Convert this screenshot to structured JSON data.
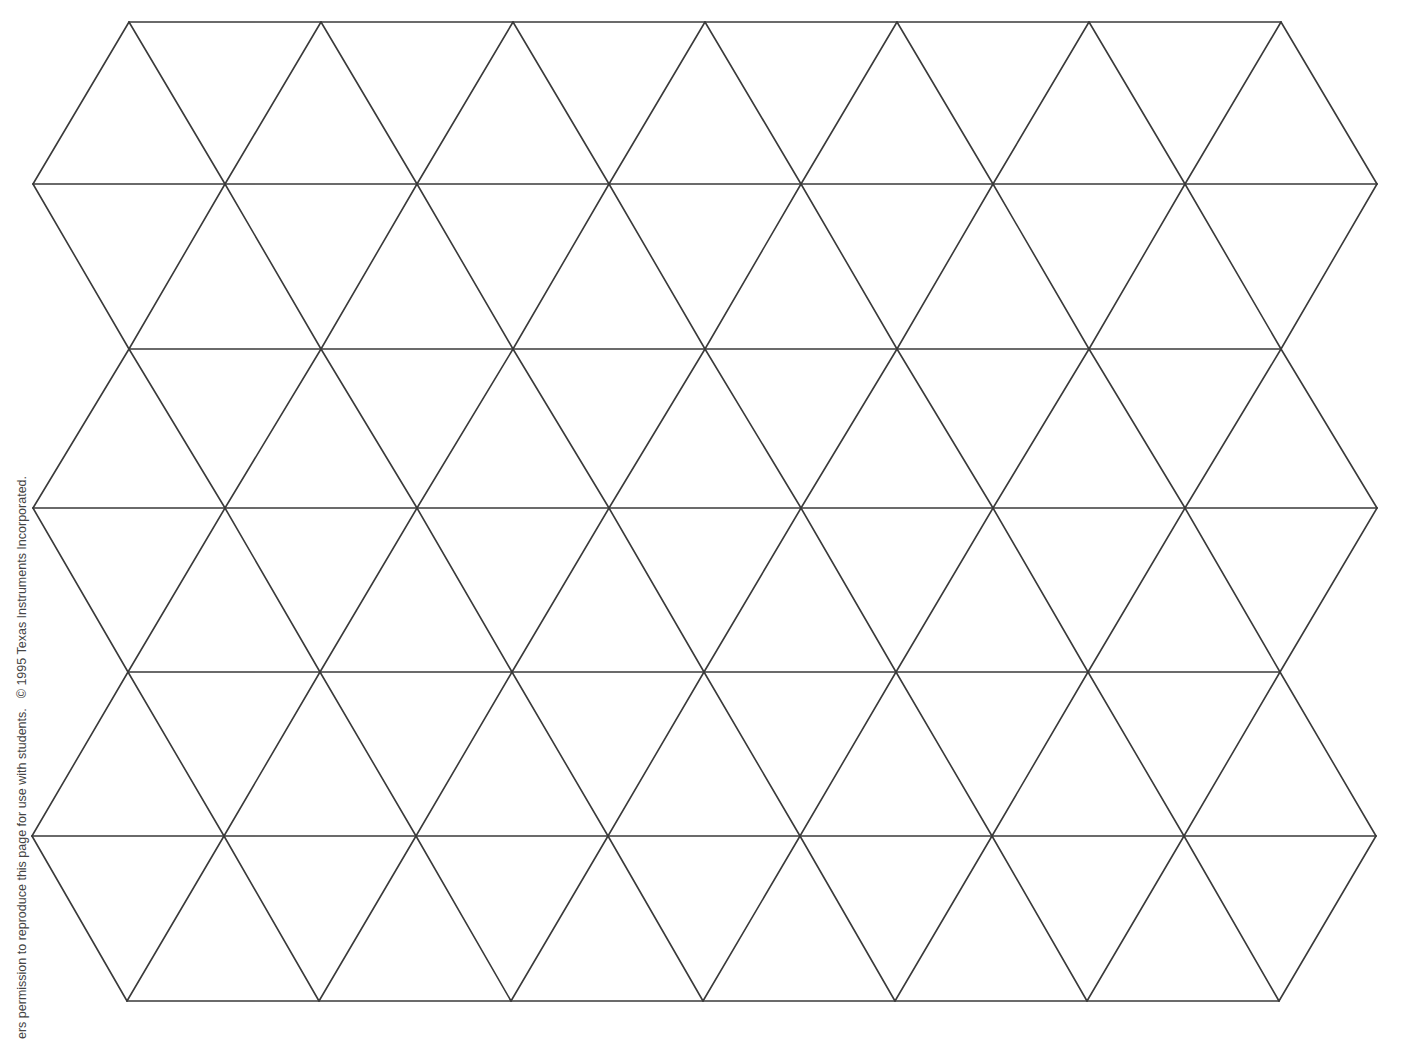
{
  "document": {
    "type": "triangle-grid-worksheet",
    "background_color": "#ffffff",
    "line_color": "#3a3a3a"
  },
  "footer": {
    "permission_text": "ers permission to reproduce this page for use with students.",
    "copyright_text": "© 1995 Texas Instruments Incorporated."
  },
  "grid": {
    "description": "Isometric equilateral-triangle lattice with hexagonal outline",
    "row_count": 7,
    "horizontal_spacing": 192,
    "rows": [
      {
        "y": 22,
        "x_start": 129,
        "count": 7
      },
      {
        "y": 184,
        "x_start": 33,
        "count": 8
      },
      {
        "y": 349,
        "x_start": 129,
        "count": 7
      },
      {
        "y": 508,
        "x_start": 33,
        "count": 8
      },
      {
        "y": 672,
        "x_start": 128,
        "count": 7
      },
      {
        "y": 836,
        "x_start": 32,
        "count": 8
      },
      {
        "y": 1001,
        "x_start": 127,
        "count": 7
      }
    ]
  }
}
